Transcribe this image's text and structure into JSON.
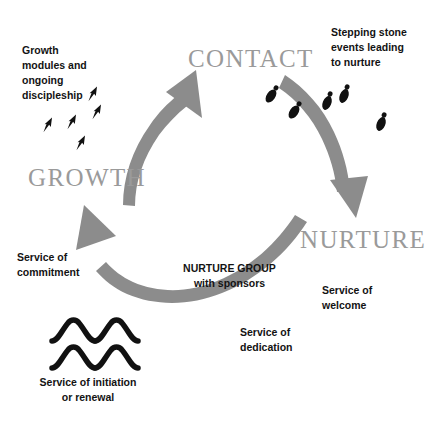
{
  "diagram": {
    "type": "cycle",
    "colors": {
      "arrow": "#8c8c8c",
      "heading": "#9a9a9a",
      "note_text": "#131313",
      "icon": "#111111",
      "background": "#ffffff"
    },
    "stages": [
      {
        "id": "contact",
        "label": "CONTACT"
      },
      {
        "id": "nurture",
        "label": "NURTURE"
      },
      {
        "id": "growth",
        "label": "GROWTH"
      }
    ],
    "arrows": [
      {
        "id": "growth-to-contact",
        "from": "GROWTH",
        "to": "CONTACT"
      },
      {
        "id": "contact-to-nurture",
        "from": "CONTACT",
        "to": "NURTURE"
      },
      {
        "id": "nurture-to-growth",
        "from": "NURTURE",
        "to": "GROWTH"
      }
    ],
    "notes": {
      "growth_modules": "Growth\nmodules and\nongoing\ndiscipleship",
      "stepping_stone": "Stepping stone\nevents leading\nto nurture",
      "service_commitment": "Service of\ncommitment",
      "nurture_group": "NURTURE GROUP\nwith sponsors",
      "service_welcome": "Service of\nwelcome",
      "service_dedication": "Service of\ndedication",
      "service_initiation": "Service of initiation\nor renewal"
    },
    "icons": {
      "footprints": "footprints-icon",
      "rising_arrows": "rising-arrows-icon",
      "water_waves": "water-waves-icon"
    },
    "footprint_count": 5,
    "rising_arrow_count": 5,
    "wave_rows": 2
  }
}
